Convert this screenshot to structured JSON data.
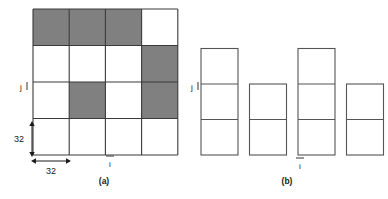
{
  "figure": {
    "panels": [
      {
        "id": "panel-a",
        "caption": "(a)",
        "axis_labels": {
          "horizontal": "i",
          "vertical": "j"
        },
        "dimensions": {
          "height_label": "32",
          "width_label": "32"
        },
        "grid": {
          "rows": 4,
          "cols": 4,
          "cells": [
            [
              "shaded",
              "shaded",
              "shaded",
              "empty"
            ],
            [
              "empty",
              "empty",
              "empty",
              "shaded"
            ],
            [
              "empty",
              "shaded",
              "empty",
              "shaded"
            ],
            [
              "empty",
              "empty",
              "empty",
              "empty"
            ]
          ]
        }
      },
      {
        "id": "panel-b",
        "caption": "(b)",
        "axis_labels": {
          "horizontal": "i",
          "vertical": "j"
        },
        "columns": [
          {
            "index": 1,
            "cell_count": 3
          },
          {
            "index": 2,
            "cell_count": 2
          },
          {
            "index": 3,
            "cell_count": 3
          },
          {
            "index": 4,
            "cell_count": 2
          }
        ]
      }
    ],
    "colors": {
      "shaded_cell": "#808080",
      "empty_cell": "#ffffff",
      "grid_stroke": "#3a3a3a",
      "column_stroke": "#555555",
      "text": "#1a1a1a",
      "background": "#ffffff"
    }
  }
}
